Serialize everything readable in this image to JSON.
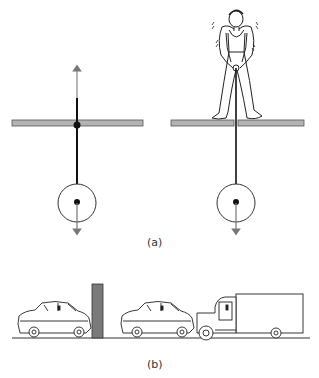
{
  "figure": {
    "panel_a": {
      "label": "(a)",
      "left": {
        "description": "rigid rod through pivot in plank, mass below, arrows up and down"
      },
      "right": {
        "description": "person standing on split plank holding rope attached to mass below, arrow down"
      }
    },
    "panel_b": {
      "label": "(b)",
      "left": {
        "description": "car crashed into wall"
      },
      "right": {
        "description": "truck rear-ends car"
      }
    },
    "colors": {
      "plank": "#b3b3b3",
      "wall": "#7a7a7a",
      "line": "#111111",
      "arrow": "#777777"
    }
  }
}
